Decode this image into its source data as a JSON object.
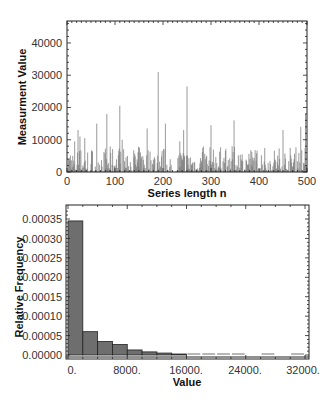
{
  "chart_data": [
    {
      "type": "bar",
      "subtype": "sequence-plot",
      "title": "",
      "xlabel": "Series length n",
      "ylabel": "Measurment Value",
      "xlim": [
        0,
        500
      ],
      "ylim": [
        0,
        46800
      ],
      "xticks": [
        "0",
        "100",
        "200",
        "300",
        "400",
        "500"
      ],
      "yticks": [
        "0",
        "10000",
        "20000",
        "30000",
        "40000"
      ],
      "grid": false,
      "bar_color": "#7a7a7a",
      "notable_peaks": [
        {
          "n": 16,
          "value": 9500
        },
        {
          "n": 23,
          "value": 13000
        },
        {
          "n": 27,
          "value": 11000
        },
        {
          "n": 37,
          "value": 10500
        },
        {
          "n": 62,
          "value": 15000
        },
        {
          "n": 83,
          "value": 18000
        },
        {
          "n": 110,
          "value": 20500
        },
        {
          "n": 115,
          "value": 10000
        },
        {
          "n": 167,
          "value": 13500
        },
        {
          "n": 190,
          "value": 31000
        },
        {
          "n": 205,
          "value": 15000
        },
        {
          "n": 235,
          "value": 9500
        },
        {
          "n": 243,
          "value": 13000
        },
        {
          "n": 250,
          "value": 26500
        },
        {
          "n": 300,
          "value": 14500
        },
        {
          "n": 348,
          "value": 16000
        },
        {
          "n": 450,
          "value": 13000
        },
        {
          "n": 487,
          "value": 14000
        },
        {
          "n": 497,
          "value": 18000
        }
      ]
    },
    {
      "type": "bar",
      "subtype": "histogram",
      "title": "",
      "xlabel": "Value",
      "ylabel": "Relative Frequency",
      "xlim": [
        0,
        32500
      ],
      "ylim": [
        0,
        0.00038
      ],
      "xticks": [
        "0.",
        "8000.",
        "16000.",
        "24000.",
        "32000."
      ],
      "yticks": [
        "0.00000",
        "0.00005",
        "0.00010",
        "0.00015",
        "0.00020",
        "0.00025",
        "0.00030",
        "0.00035"
      ],
      "grid": false,
      "bar_color": "#6e6e6e",
      "bin_width": 2000,
      "categories": [
        "0-2000",
        "2000-4000",
        "4000-6000",
        "6000-8000",
        "8000-10000",
        "10000-12000",
        "12000-14000",
        "14000-16000",
        "16000-18000",
        "18000-20000",
        "20000-22000",
        "22000-24000",
        "24000-26000",
        "26000-28000",
        "28000-30000",
        "30000-32000"
      ],
      "values": [
        0.000345,
        6e-05,
        3.5e-05,
        2.7e-05,
        1.3e-05,
        8e-06,
        5e-06,
        2e-06,
        1.5e-06,
        1.5e-06,
        1.5e-06,
        7e-07,
        0,
        7e-07,
        0,
        7e-07
      ]
    }
  ],
  "top_chart": {
    "xlabel": "Series length n",
    "ylabel": "Measurment Value",
    "xticks": [
      "0",
      "100",
      "200",
      "300",
      "400",
      "500"
    ],
    "yticks": [
      "0",
      "10000",
      "20000",
      "30000",
      "40000"
    ]
  },
  "bottom_chart": {
    "xlabel": "Value",
    "ylabel": "Relative Frequency",
    "xticks": [
      "0.",
      "8000.",
      "16000.",
      "24000.",
      "32000."
    ],
    "yticks": [
      "0.00000",
      "0.00005",
      "0.00010",
      "0.00015",
      "0.00020",
      "0.00025",
      "0.00030",
      "0.00035"
    ]
  }
}
